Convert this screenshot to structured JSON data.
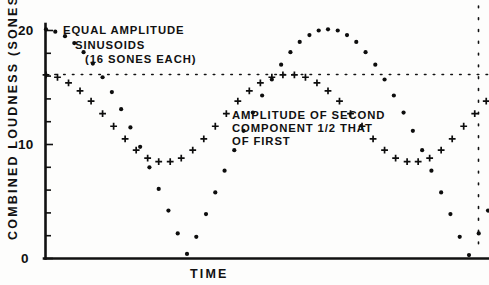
{
  "chart_data": {
    "type": "line",
    "title": "",
    "xlabel": "TIME",
    "ylabel": "COMBINED LOUDNESS (SONES)",
    "ylim": [
      0,
      21.5
    ],
    "xlim": [
      0,
      1
    ],
    "grid": false,
    "legend_position": "none",
    "ytick_labels": [
      "0",
      "10",
      "20"
    ],
    "ytick_values": [
      0,
      10,
      20
    ],
    "yminor_tick_values": [
      2,
      4,
      6,
      8,
      12,
      14,
      16,
      18
    ],
    "xtick_labels": [],
    "annotations": [
      {
        "name": "equal-amplitude-annotation",
        "lines": [
          "EQUAL AMPLITUDE",
          "SINUSOIDS",
          "(16 SONES EACH)"
        ],
        "x": 0.18,
        "y": 20.2
      },
      {
        "name": "second-component-annotation",
        "lines": [
          "AMPLITUDE OF SECOND",
          "COMPONENT 1/2 THAT",
          "OF FIRST"
        ],
        "x": 0.46,
        "y": 13.2
      }
    ],
    "reference_lines": [
      {
        "name": "sixteen-sones-dotted-line",
        "orientation": "horizontal",
        "value": 16.1,
        "style": "dotted"
      },
      {
        "name": "right-boundary-dotted-line",
        "orientation": "vertical",
        "value": 1.0,
        "style": "dotted"
      }
    ],
    "series": [
      {
        "name": "EQUAL AMPLITUDE SINUSOIDS (16 SONES EACH)",
        "marker": "dot",
        "peak_value": 20.1,
        "minimum_value": 0,
        "x": [
          0.0,
          0.021,
          0.043,
          0.064,
          0.085,
          0.106,
          0.128,
          0.149,
          0.17,
          0.191,
          0.213,
          0.234,
          0.255,
          0.277,
          0.298,
          0.319,
          0.34,
          0.362,
          0.383,
          0.404,
          0.426,
          0.447,
          0.468,
          0.489,
          0.511,
          0.532,
          0.553,
          0.574,
          0.596,
          0.617,
          0.638,
          0.66,
          0.681,
          0.702,
          0.723,
          0.745,
          0.766,
          0.787,
          0.809,
          0.83,
          0.851,
          0.872,
          0.894,
          0.915,
          0.936,
          0.957,
          0.979,
          1.0
        ],
        "y": [
          20.1,
          19.9,
          19.5,
          18.9,
          18.1,
          17.1,
          15.9,
          14.6,
          13.1,
          11.5,
          9.8,
          8.0,
          6.1,
          4.2,
          2.2,
          0.4,
          1.9,
          3.9,
          5.8,
          7.7,
          9.5,
          11.2,
          12.8,
          14.3,
          15.7,
          17.0,
          18.1,
          19.0,
          19.6,
          20.0,
          20.1,
          20.0,
          19.6,
          19.0,
          18.1,
          17.0,
          15.7,
          14.3,
          12.8,
          11.2,
          9.5,
          7.7,
          5.8,
          3.9,
          1.9,
          0.3,
          2.2,
          4.2
        ]
      },
      {
        "name": "AMPLITUDE OF SECOND COMPONENT 1/2 THAT OF FIRST",
        "marker": "plus",
        "peak_value": 16.1,
        "minimum_value": 8.4,
        "x": [
          0.0,
          0.026,
          0.051,
          0.077,
          0.102,
          0.128,
          0.153,
          0.179,
          0.204,
          0.23,
          0.255,
          0.281,
          0.306,
          0.332,
          0.357,
          0.383,
          0.408,
          0.434,
          0.46,
          0.485,
          0.511,
          0.536,
          0.562,
          0.587,
          0.613,
          0.638,
          0.664,
          0.689,
          0.715,
          0.74,
          0.766,
          0.791,
          0.817,
          0.842,
          0.868,
          0.894,
          0.919,
          0.945,
          0.97,
          0.996
        ],
        "y": [
          16.1,
          15.9,
          15.4,
          14.7,
          13.8,
          12.7,
          11.6,
          10.5,
          9.5,
          8.8,
          8.5,
          8.5,
          8.8,
          9.5,
          10.5,
          11.6,
          12.7,
          13.8,
          14.7,
          15.4,
          15.9,
          16.1,
          16.1,
          15.9,
          15.4,
          14.7,
          13.8,
          12.7,
          11.6,
          10.5,
          9.5,
          8.8,
          8.5,
          8.5,
          8.8,
          9.5,
          10.5,
          11.6,
          12.7,
          13.8
        ]
      }
    ]
  },
  "axis": {
    "y_title": "COMBINED LOUDNESS (SONES)",
    "x_title": "TIME"
  }
}
